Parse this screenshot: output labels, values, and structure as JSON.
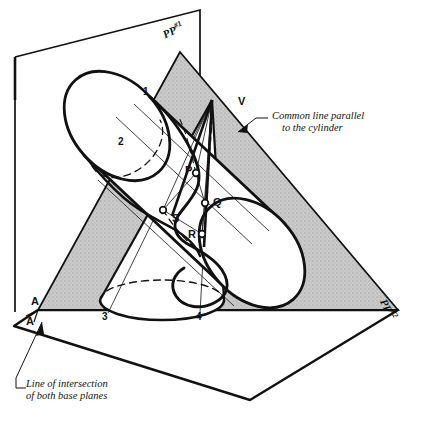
{
  "figure": {
    "kind": "technical-descriptive-geometry-drawing",
    "title_visible": false,
    "background_color": "#ffffff",
    "ink_color": "#111111",
    "shaded_plane_color": "#c4c4c4"
  },
  "planes": {
    "vertical_plane_label": "PP",
    "vertical_plane_index": "#1",
    "base_plane_label": "PP",
    "base_plane_index": "#2"
  },
  "annotations": {
    "common_line": {
      "line1": "Common line parallel",
      "line2": "to the cylinder"
    },
    "intersection_line": {
      "line1": "Line of intersection",
      "line2": "of both base planes"
    }
  },
  "points": {
    "apex": "V",
    "p": "P",
    "q": "Q",
    "r": "R",
    "s": "S",
    "a_upper": "A",
    "a_lower": "A",
    "one": "1",
    "two": "2",
    "three": "3",
    "four": "4"
  },
  "solids": {
    "cone_name": "cone",
    "cylinder_name": "cylinder"
  }
}
